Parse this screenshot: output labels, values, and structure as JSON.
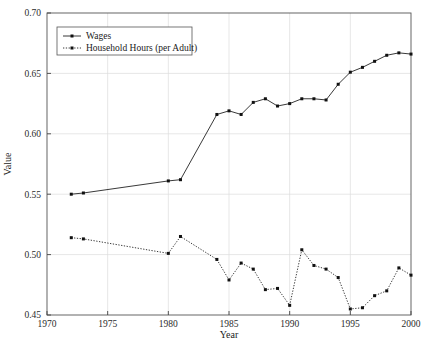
{
  "chart_data": {
    "type": "line",
    "title": "",
    "xlabel": "Year",
    "ylabel": "Value",
    "xlim": [
      1970,
      2000
    ],
    "ylim": [
      0.45,
      0.7
    ],
    "xticks": [
      1970,
      1975,
      1980,
      1985,
      1990,
      1995,
      2000
    ],
    "xtick_labels": [
      "1970",
      "1975",
      "1980",
      "1985",
      "1990",
      "1995",
      "2000"
    ],
    "yticks": [
      0.45,
      0.5,
      0.55,
      0.6,
      0.65,
      0.7
    ],
    "ytick_labels": [
      "0.45",
      "0.50",
      "0.55",
      "0.60",
      "0.65",
      "0.70"
    ],
    "grid": true,
    "grid_axis": "x",
    "legend_position": "upper left",
    "markers": true,
    "series": [
      {
        "name": "Wages",
        "linestyle": "solid",
        "marker": "square",
        "color": "#222222",
        "x": [
          1972,
          1973,
          1980,
          1981,
          1984,
          1985,
          1986,
          1987,
          1988,
          1989,
          1990,
          1991,
          1992,
          1993,
          1994,
          1995,
          1996,
          1997,
          1998,
          1999,
          2000
        ],
        "y": [
          0.55,
          0.551,
          0.561,
          0.562,
          0.616,
          0.619,
          0.616,
          0.626,
          0.629,
          0.623,
          0.625,
          0.629,
          0.629,
          0.628,
          0.641,
          0.651,
          0.655,
          0.66,
          0.665,
          0.667,
          0.666
        ]
      },
      {
        "name": "Household Hours (per Adult)",
        "linestyle": "dotted",
        "marker": "square",
        "color": "#222222",
        "x": [
          1972,
          1973,
          1980,
          1981,
          1984,
          1985,
          1986,
          1987,
          1988,
          1989,
          1990,
          1991,
          1992,
          1993,
          1994,
          1995,
          1996,
          1997,
          1998,
          1999,
          2000
        ],
        "y": [
          0.514,
          0.513,
          0.501,
          0.515,
          0.496,
          0.479,
          0.493,
          0.488,
          0.471,
          0.472,
          0.458,
          0.504,
          0.491,
          0.488,
          0.481,
          0.455,
          0.456,
          0.466,
          0.47,
          0.489,
          0.483
        ]
      }
    ]
  },
  "legend": {
    "entries": [
      {
        "label": "Wages"
      },
      {
        "label": "Household Hours (per Adult)"
      }
    ]
  },
  "axes": {
    "x_title": "Year",
    "y_title": "Value"
  }
}
